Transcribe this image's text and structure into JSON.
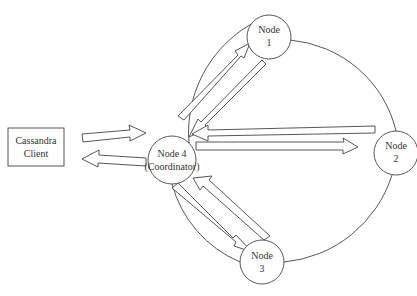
{
  "diagram": {
    "client": {
      "line1": "Cassandra",
      "line2": "Client"
    },
    "coordinator": {
      "line1": "Node 4",
      "line2": "(Coordinator)"
    },
    "nodes": [
      {
        "line1": "Node",
        "line2": "1"
      },
      {
        "line1": "Node",
        "line2": "2"
      },
      {
        "line1": "Node",
        "line2": "3"
      }
    ],
    "edges": [
      {
        "from": "Cassandra Client",
        "to": "Node 4 (Coordinator)",
        "style": "block-arrow"
      },
      {
        "from": "Node 4 (Coordinator)",
        "to": "Cassandra Client",
        "style": "block-arrow"
      },
      {
        "from": "Node 4 (Coordinator)",
        "to": "Node 1",
        "style": "block-arrow"
      },
      {
        "from": "Node 1",
        "to": "Node 4 (Coordinator)",
        "style": "block-arrow"
      },
      {
        "from": "Node 4 (Coordinator)",
        "to": "Node 2",
        "style": "block-arrow"
      },
      {
        "from": "Node 2",
        "to": "Node 4 (Coordinator)",
        "style": "block-arrow"
      },
      {
        "from": "Node 4 (Coordinator)",
        "to": "Node 3",
        "style": "block-arrow"
      },
      {
        "from": "Node 3",
        "to": "Node 4 (Coordinator)",
        "style": "block-arrow"
      }
    ],
    "colors": {
      "stroke": "#444444",
      "background": "#ffffff",
      "text": "#333333"
    }
  }
}
